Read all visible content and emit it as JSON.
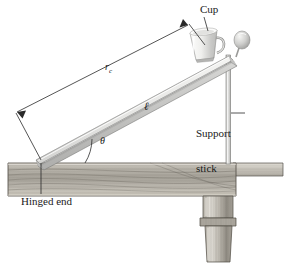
{
  "figure": {
    "type": "physics-diagram",
    "background_color": "#ffffff",
    "ink_color": "#1a1a1a"
  },
  "labels": {
    "cup": "Cup",
    "support_stick_line1": "Support",
    "support_stick_line2": "stick",
    "hinged_end": "Hinged end",
    "distance_to_cup": "r",
    "distance_to_cup_sub": "c",
    "board_length": "ℓ",
    "angle": "θ"
  },
  "parts": {
    "board": "inclined-board",
    "cup": "coffee-mug",
    "ball": "ball-knob",
    "support_stick": "vertical-support-stick",
    "table_top": "table-top",
    "table_leg": "turned-table-leg",
    "hinge": "hinge-pivot"
  },
  "colors": {
    "board_face": "#e8e8e6",
    "board_edge": "#b9b9b7",
    "board_shadow": "#c9c9c7",
    "cup_body": "#f2f2f0",
    "cup_shade": "#c6c6c4",
    "ball_light": "#f0f0ee",
    "ball_dark": "#a9a9a7",
    "stick": "#d8d8d6",
    "wood_light": "#d5d2cb",
    "wood_mid": "#b0aca3",
    "wood_dark": "#7e7a71",
    "leader": "#2a2a2a"
  },
  "geometry": {
    "hinge_point": [
      41,
      161
    ],
    "board_far_end": [
      233,
      57
    ],
    "cup_position": [
      205,
      44
    ],
    "ball_position": [
      242,
      40
    ],
    "support_stick_x": 228,
    "table_top_y": 163,
    "angle_arc_degrees": 28,
    "dimension_arrow_start": [
      16,
      113
    ],
    "dimension_arrow_end": [
      189,
      24
    ]
  }
}
